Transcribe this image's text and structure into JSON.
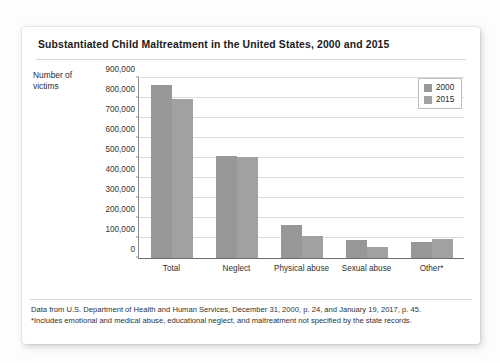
{
  "figure": {
    "title": "Substantiated Child Maltreatment in the United States, 2000 and 2015",
    "axis_title": "Number of victims",
    "footnotes": [
      "Data from U.S. Department of Health and Human Services, December 31, 2000, p. 24, and January 19, 2017, p. 45.",
      "*Includes emotional and medical abuse, educational neglect, and maltreatment not specified by the state records."
    ]
  },
  "colors": {
    "bar_2000": "#969797",
    "bar_2015": "#a0a1a1",
    "gridline": "#dcdcdc",
    "axis": "#6e6e6e",
    "card_background": "#ffffff",
    "page_background": "#fdfdfd"
  },
  "chart_data": {
    "type": "bar",
    "title": "Substantiated Child Maltreatment in the United States, 2000 and 2015",
    "xlabel": "",
    "ylabel": "Number of victims",
    "ylim": [
      0,
      900000
    ],
    "ytick_step": 100000,
    "ytick_labels": [
      "900,000",
      "800,000",
      "700,000",
      "600,000",
      "500,000",
      "400,000",
      "300,000",
      "200,000",
      "100,000",
      "0"
    ],
    "ytick_values": [
      900000,
      800000,
      700000,
      600000,
      500000,
      400000,
      300000,
      200000,
      100000,
      0
    ],
    "grid": true,
    "legend_position": "top-right",
    "categories": [
      "Total",
      "Neglect",
      "Physical abuse",
      "Sexual abuse",
      "Other*"
    ],
    "series": [
      {
        "name": "2000",
        "color": "#969797",
        "values": [
          865000,
          508000,
          165000,
          88000,
          78000
        ]
      },
      {
        "name": "2015",
        "color": "#a0a1a1",
        "values": [
          795000,
          505000,
          110000,
          57000,
          95000
        ]
      }
    ]
  }
}
